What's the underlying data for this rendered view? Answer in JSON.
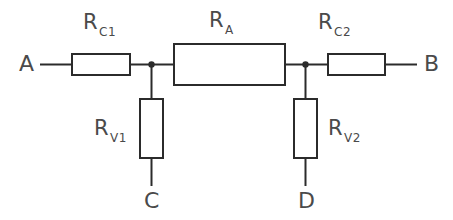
{
  "diagram": {
    "background_color": "#ffffff",
    "line_color": "#2b2b2b",
    "text_color": "#4a4a4a",
    "terminals": [
      {
        "id": "A",
        "label": "A"
      },
      {
        "id": "B",
        "label": "B"
      },
      {
        "id": "C",
        "label": "C"
      },
      {
        "id": "D",
        "label": "D"
      }
    ],
    "components": [
      {
        "id": "Rc1",
        "base": "R",
        "subscript": "C1",
        "orientation": "horizontal",
        "position": "left-series"
      },
      {
        "id": "RA",
        "base": "R",
        "subscript": "A",
        "orientation": "horizontal",
        "position": "center-series"
      },
      {
        "id": "Rc2",
        "base": "R",
        "subscript": "C2",
        "orientation": "horizontal",
        "position": "right-series"
      },
      {
        "id": "Rv1",
        "base": "R",
        "subscript": "V1",
        "orientation": "vertical",
        "position": "left-shunt"
      },
      {
        "id": "Rv2",
        "base": "R",
        "subscript": "V2",
        "orientation": "vertical",
        "position": "right-shunt"
      }
    ],
    "nodes": [
      {
        "id": "node-left",
        "label": ""
      },
      {
        "id": "node-right",
        "label": ""
      }
    ]
  }
}
